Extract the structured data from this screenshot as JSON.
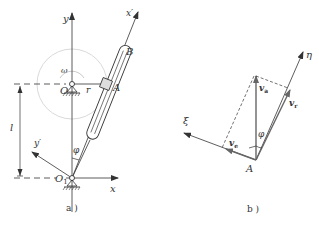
{
  "figure_a": {
    "caption": "a )",
    "labels": {
      "y": "y",
      "x_prime": "x′",
      "B": "B",
      "A": "A",
      "O": "O",
      "r": "r",
      "omega": "ω",
      "l": "l",
      "y_prime": "y′",
      "phi": "φ",
      "O1": "O",
      "O1_sub": "1",
      "x": "x"
    }
  },
  "figure_b": {
    "caption": "b )",
    "labels": {
      "eta": "η",
      "xi": "ξ",
      "va": "v",
      "va_sub": "a",
      "vr": "v",
      "vr_sub": "r",
      "ve": "v",
      "ve_sub": "e",
      "phi": "φ",
      "A": "A"
    }
  },
  "colors": {
    "line": "#333333",
    "circle": "#c8c8c8",
    "vector": "#555555"
  }
}
